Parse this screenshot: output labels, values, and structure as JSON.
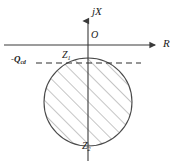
{
  "figure": {
    "background_color": "#ffffff",
    "line_color": "#3a3a3a",
    "hatch_color": "#8a8a8a",
    "width": 176,
    "height": 167
  },
  "axes": {
    "vertical": {
      "label": "jX",
      "name": "reactance-axis",
      "x": 88,
      "top": 18,
      "bottom": 161,
      "arrow": "up"
    },
    "horizontal": {
      "label": "R",
      "name": "resistance-axis",
      "y": 45,
      "left": 4,
      "right": 158,
      "arrow": "right"
    },
    "origin_label": "O"
  },
  "annotations": [
    {
      "id": "z1",
      "label": "Z",
      "subscript": "1",
      "description": "upper intersection point label"
    },
    {
      "id": "z2",
      "label": "Z",
      "subscript": "2",
      "description": "lower intersection point label"
    },
    {
      "id": "qcd",
      "label": "-Q",
      "subscript": "cd",
      "description": "dashed horizontal reference line level"
    }
  ],
  "dashed_line": {
    "name": "qcd-reference-line",
    "y": 63,
    "left": 36,
    "right": 141,
    "dash_pattern": "6 4"
  },
  "circle": {
    "name": "impedance-circle",
    "cx": 88,
    "cy": 102,
    "r": 44,
    "fill": "none",
    "hatching": {
      "angle_deg": 45,
      "spacing_px": 10,
      "direction": "lower-left to upper-right"
    }
  },
  "icons": {
    "arrow_up": "arrow-up-icon",
    "arrow_right": "arrow-right-icon"
  }
}
